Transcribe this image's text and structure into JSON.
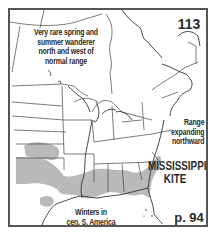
{
  "map": {
    "plate_number": "113",
    "species_name_line1": "MISSISSIPPI",
    "species_name_line2": "KITE",
    "page_ref": "p. 94",
    "notes": {
      "wanderer": [
        "Very rare spring and",
        "summer wanderer",
        "north and west of",
        "normal range"
      ],
      "range": [
        "Range",
        "expanding",
        "northward"
      ],
      "winter": [
        "Winters in",
        "cen. S. America"
      ]
    },
    "colors": {
      "frame": "#555555",
      "range_fill": "#b9b9b9",
      "lines": "#444444"
    }
  }
}
